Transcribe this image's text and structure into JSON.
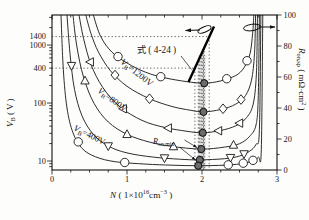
{
  "labels": {
    "eq": "式 ( 4-24 )",
    "left_axis": {
      "main": "V",
      "sub": "B",
      "rest": " ( V )"
    },
    "right_axis": {
      "main": "R",
      "sub": "on,sp",
      "rest": " ( mΩ·cm",
      "sup": "2",
      "close": " )"
    },
    "x_axis": {
      "main": "N",
      "p1": " ( 1×10",
      "sup1": "16",
      "p2": "cm",
      "sup2": "−3",
      "close": " )"
    },
    "vb1200": {
      "main": "V",
      "sub": "B",
      "rest": "=1200V"
    },
    "vb800": {
      "main": "V",
      "sub": "B",
      "rest": "=800V"
    },
    "vb400": {
      "main": "V",
      "sub": "B",
      "rest": "=400V"
    },
    "ronmin": {
      "main": "R",
      "sub": "on,min"
    }
  },
  "chart_data": {
    "type": "line",
    "title": "",
    "xlabel": "N ( 1×10^16 cm^-3 )",
    "x_axis": {
      "range": [
        0,
        3
      ],
      "major_values": [
        0,
        1,
        2,
        3
      ],
      "major_labels": [
        "0",
        "1",
        "2",
        "3"
      ],
      "minor_step": 0.25
    },
    "left_axis": {
      "label": "V_B ( V )",
      "scale": "log",
      "range": [
        7,
        3300
      ],
      "tick_values": [
        10,
        100,
        400,
        1000,
        1400
      ],
      "tick_labels": [
        "10",
        "100",
        "400",
        "1000",
        "1400"
      ],
      "major_decades": [
        10,
        100,
        1000
      ]
    },
    "right_axis": {
      "label": "R_on,sp ( mΩ·cm² )",
      "range": [
        0,
        100
      ],
      "major_values": [
        0,
        20,
        40,
        60,
        80,
        100
      ],
      "major_labels": [
        "0",
        "20",
        "40",
        "60",
        "80",
        "100"
      ],
      "minor_step": 10
    },
    "series": [
      {
        "name": "VB=1400V",
        "marker": "circle",
        "axis": "right",
        "min_point": [
          2.03,
          56
        ],
        "marker_x": [
          0.88,
          1.45,
          2.33,
          2.6
        ],
        "points": [
          [
            0.55,
            100
          ],
          [
            0.65,
            86
          ],
          [
            0.8,
            76
          ],
          [
            1.0,
            69
          ],
          [
            1.25,
            63
          ],
          [
            1.5,
            59.5
          ],
          [
            1.8,
            57
          ],
          [
            2.03,
            56
          ],
          [
            2.25,
            57.5
          ],
          [
            2.45,
            61
          ],
          [
            2.56,
            66
          ],
          [
            2.64,
            75
          ],
          [
            2.675,
            88
          ],
          [
            2.69,
            100
          ]
        ]
      },
      {
        "name": "VB=1200V",
        "marker": "diamond",
        "axis": "right",
        "min_point": [
          2.02,
          37.5
        ],
        "marker_x": [
          0.84,
          1.3,
          2.28,
          2.52
        ],
        "points": [
          [
            0.45,
            100
          ],
          [
            0.52,
            88
          ],
          [
            0.62,
            76
          ],
          [
            0.78,
            64
          ],
          [
            1.0,
            54
          ],
          [
            1.3,
            46
          ],
          [
            1.6,
            41
          ],
          [
            1.85,
            38.5
          ],
          [
            2.02,
            37.5
          ],
          [
            2.25,
            39
          ],
          [
            2.45,
            42.5
          ],
          [
            2.58,
            48
          ],
          [
            2.66,
            58
          ],
          [
            2.7,
            75
          ],
          [
            2.715,
            100
          ]
        ]
      },
      {
        "name": "VB=1000V",
        "marker": "triangle-left",
        "axis": "right",
        "min_point": [
          2.01,
          24
        ],
        "marker_x": [
          0.51,
          0.95,
          1.55,
          2.22,
          2.5
        ],
        "points": [
          [
            0.36,
            100
          ],
          [
            0.42,
            85
          ],
          [
            0.52,
            68
          ],
          [
            0.68,
            53
          ],
          [
            0.9,
            41
          ],
          [
            1.2,
            32
          ],
          [
            1.5,
            27.5
          ],
          [
            1.8,
            25
          ],
          [
            2.01,
            24
          ],
          [
            2.25,
            25.5
          ],
          [
            2.45,
            28.5
          ],
          [
            2.58,
            33
          ],
          [
            2.68,
            42
          ],
          [
            2.725,
            62
          ],
          [
            2.74,
            100
          ]
        ]
      },
      {
        "name": "VB=800V",
        "marker": "triangle-up",
        "axis": "right",
        "min_point": [
          1.99,
          13.5
        ],
        "marker_x": [
          0.44,
          1.0,
          1.62,
          2.42
        ],
        "points": [
          [
            0.28,
            100
          ],
          [
            0.33,
            80
          ],
          [
            0.42,
            60
          ],
          [
            0.56,
            43
          ],
          [
            0.75,
            31
          ],
          [
            1.0,
            23
          ],
          [
            1.3,
            18
          ],
          [
            1.6,
            15.2
          ],
          [
            1.99,
            13.5
          ],
          [
            2.3,
            14.8
          ],
          [
            2.5,
            17
          ],
          [
            2.63,
            21.5
          ],
          [
            2.72,
            29
          ],
          [
            2.75,
            48
          ],
          [
            2.765,
            100
          ]
        ]
      },
      {
        "name": "VB=600V",
        "marker": "triangle-down",
        "axis": "right",
        "min_point": [
          1.97,
          6.5
        ],
        "marker_x": [
          0.26,
          0.75,
          1.5,
          2.38,
          2.56
        ],
        "points": [
          [
            0.2,
            100
          ],
          [
            0.24,
            75
          ],
          [
            0.3,
            52
          ],
          [
            0.4,
            35
          ],
          [
            0.55,
            23
          ],
          [
            0.75,
            15.5
          ],
          [
            1.0,
            11
          ],
          [
            1.35,
            8.3
          ],
          [
            1.7,
            7
          ],
          [
            1.97,
            6.5
          ],
          [
            2.3,
            7.3
          ],
          [
            2.5,
            9
          ],
          [
            2.63,
            12
          ],
          [
            2.72,
            16.5
          ],
          [
            2.765,
            26
          ],
          [
            2.785,
            100
          ]
        ]
      },
      {
        "name": "VB=400V",
        "marker": "circle",
        "axis": "right",
        "min_point": [
          1.95,
          2.8
        ],
        "marker_x": [
          0.35,
          0.97,
          2.35,
          2.55,
          2.68
        ],
        "points": [
          [
            0.12,
            100
          ],
          [
            0.15,
            65
          ],
          [
            0.2,
            40
          ],
          [
            0.28,
            24
          ],
          [
            0.4,
            14
          ],
          [
            0.58,
            8.5
          ],
          [
            0.85,
            5.3
          ],
          [
            1.25,
            3.8
          ],
          [
            1.6,
            3.1
          ],
          [
            1.95,
            2.8
          ],
          [
            2.3,
            3.1
          ],
          [
            2.5,
            3.9
          ],
          [
            2.65,
            5.4
          ],
          [
            2.75,
            8.2
          ],
          [
            2.79,
            13
          ],
          [
            2.81,
            100
          ]
        ]
      }
    ],
    "eq_line": {
      "label": "式 ( 4-24 )",
      "axis": "left",
      "points_NV": [
        [
          1.82,
          230
        ],
        [
          2.16,
          2100
        ]
      ]
    },
    "guides": {
      "h_dotted_V": [
        1400,
        400
      ],
      "v_dotted_N": [
        1.905,
        1.95,
        1.97,
        1.99,
        2.01,
        2.02,
        2.03,
        2.096
      ],
      "band_N": [
        1.95,
        2.05
      ]
    },
    "colors": {
      "curve": "#222222",
      "frame": "#111111",
      "band": "#c9c9c9",
      "min_fill": "#6b6b6b",
      "dotted": "#333333"
    }
  }
}
